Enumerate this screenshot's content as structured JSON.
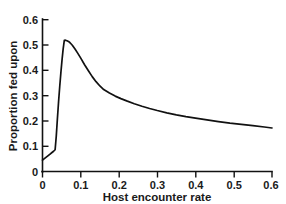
{
  "chart_data": {
    "type": "line",
    "title": "",
    "subtitle": "",
    "xlabel": "Host encounter rate",
    "ylabel": "Proportion fed upon",
    "xlim": [
      0,
      0.6
    ],
    "ylim": [
      0,
      0.6
    ],
    "grid": false,
    "legend": null,
    "legend_position": "none",
    "xticks": [
      0,
      0.1,
      0.2,
      0.3,
      0.4,
      0.5,
      0.6
    ],
    "xtick_labels": [
      "0",
      "0.1",
      "0.2",
      "0.3",
      "0.4",
      "0.5",
      "0.6"
    ],
    "yticks": [
      0,
      0.1,
      0.2,
      0.3,
      0.4,
      0.5,
      0.6
    ],
    "ytick_labels": [
      "0",
      "0.1",
      "0.2",
      "0.3",
      "0.4",
      "0.5",
      "0.6"
    ],
    "series": [
      {
        "name": "Proportion fed upon",
        "color": "#111111",
        "x": [
          0.0,
          0.004,
          0.009,
          0.014,
          0.019,
          0.024,
          0.029,
          0.033,
          0.036,
          0.039,
          0.042,
          0.045,
          0.048,
          0.051,
          0.054,
          0.057,
          0.06,
          0.064,
          0.068,
          0.072,
          0.078,
          0.085,
          0.092,
          0.1,
          0.11,
          0.12,
          0.13,
          0.14,
          0.15,
          0.16,
          0.175,
          0.19,
          0.205,
          0.22,
          0.24,
          0.26,
          0.28,
          0.3,
          0.325,
          0.35,
          0.375,
          0.4,
          0.43,
          0.46,
          0.49,
          0.52,
          0.55,
          0.58,
          0.6
        ],
        "values": [
          0.045,
          0.05,
          0.056,
          0.062,
          0.068,
          0.074,
          0.08,
          0.086,
          0.14,
          0.21,
          0.275,
          0.335,
          0.39,
          0.44,
          0.485,
          0.518,
          0.519,
          0.517,
          0.514,
          0.509,
          0.499,
          0.484,
          0.468,
          0.448,
          0.422,
          0.398,
          0.375,
          0.355,
          0.338,
          0.324,
          0.31,
          0.298,
          0.288,
          0.279,
          0.268,
          0.258,
          0.249,
          0.241,
          0.232,
          0.224,
          0.217,
          0.211,
          0.204,
          0.197,
          0.191,
          0.186,
          0.181,
          0.176,
          0.172
        ]
      }
    ],
    "annotations": [],
    "notes": {
      "peak_x": 0.057,
      "peak_y": 0.52,
      "start_y": 0.045,
      "end_y": 0.17
    }
  },
  "axes": {
    "x_title": "Host encounter rate",
    "y_title": "Proportion fed upon"
  },
  "ticks": {
    "x": [
      "0",
      "0.1",
      "0.2",
      "0.3",
      "0.4",
      "0.5",
      "0.6"
    ],
    "y": [
      "0",
      "0.1",
      "0.2",
      "0.3",
      "0.4",
      "0.5",
      "0.6"
    ]
  }
}
